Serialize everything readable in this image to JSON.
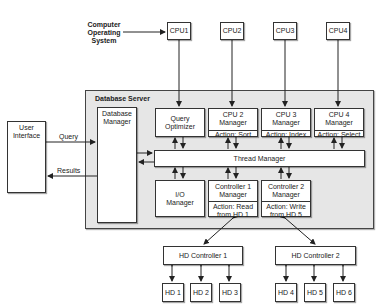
{
  "os_label": [
    "Computer",
    "Operating",
    "System"
  ],
  "cpus": [
    {
      "label": "CPU1"
    },
    {
      "label": "CPU2"
    },
    {
      "label": "CPU3"
    },
    {
      "label": "CPU4"
    }
  ],
  "server": {
    "title": "Database Server",
    "db_manager": [
      "Database",
      "Manager"
    ],
    "query_optimizer": [
      "Query",
      "Optimizer"
    ],
    "cpu_managers": [
      {
        "name": [
          "CPU 2",
          "Manager"
        ],
        "action": "Action: Sort"
      },
      {
        "name": [
          "CPU 3",
          "Manager"
        ],
        "action": "Action: Index"
      },
      {
        "name": [
          "CPU 4",
          "Manager"
        ],
        "action": "Action: Select"
      }
    ],
    "thread_manager": "Thread Manager",
    "io_manager": [
      "I/O",
      "Manager"
    ],
    "controller_managers": [
      {
        "name": [
          "Controller 1",
          "Manager"
        ],
        "action": [
          "Action: Read",
          "from HD 1"
        ]
      },
      {
        "name": [
          "Controller 2",
          "Manager"
        ],
        "action": [
          "Action: Write",
          "from HD 5"
        ]
      }
    ]
  },
  "user_interface": [
    "User",
    "Interface"
  ],
  "flows": {
    "query": "Query",
    "results": "Results"
  },
  "hd_controllers": [
    {
      "label": "HD Controller 1",
      "disks": [
        "HD 1",
        "HD 2",
        "HD 3"
      ]
    },
    {
      "label": "HD Controller 2",
      "disks": [
        "HD 4",
        "HD 5",
        "HD 6"
      ]
    }
  ]
}
